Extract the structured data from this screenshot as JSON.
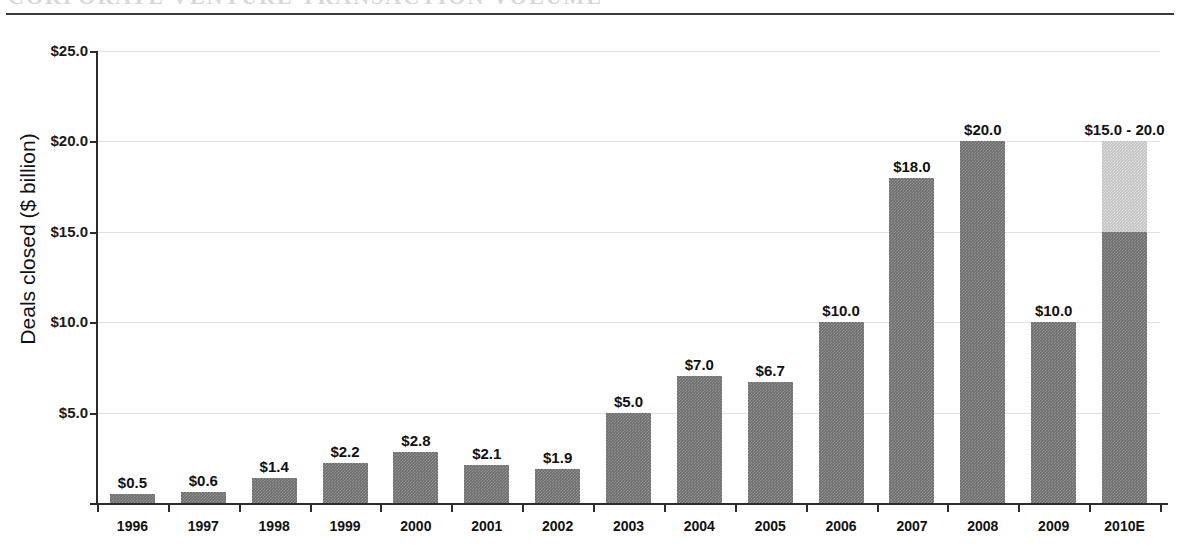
{
  "document": {
    "title_clipped": "CORPORATE VENTURE TRANSACTION VOLUME",
    "rule": "horizontal-rule"
  },
  "chart_data": {
    "type": "bar",
    "title": "",
    "xlabel": "",
    "ylabel": "Deals closed ($ billion)",
    "ylim": [
      0,
      25
    ],
    "ytick_labels": [
      "$25.0",
      "$20.0",
      "$15.0",
      "$10.0",
      "$5.0"
    ],
    "ytick_values": [
      25,
      20,
      15,
      10,
      5
    ],
    "grid": true,
    "legend": "none",
    "categories": [
      "1996",
      "1997",
      "1998",
      "1999",
      "2000",
      "2001",
      "2002",
      "2003",
      "2004",
      "2005",
      "2006",
      "2007",
      "2008",
      "2009",
      "2010E"
    ],
    "values": [
      0.5,
      0.6,
      1.4,
      2.2,
      2.8,
      2.1,
      1.9,
      5.0,
      7.0,
      6.7,
      10.0,
      18.0,
      20.0,
      10.0,
      20.0
    ],
    "value_labels": [
      "$0.5",
      "$0.6",
      "$1.4",
      "$2.2",
      "$2.8",
      "$2.1",
      "$1.9",
      "$5.0",
      "$7.0",
      "$6.7",
      "$10.0",
      "$18.0",
      "$20.0",
      "$10.0",
      "$15.0 - 20.0"
    ],
    "bars": [
      {
        "category": "1996",
        "value": 0.5,
        "label": "$0.5",
        "base_value": 0.5,
        "range_top": null
      },
      {
        "category": "1997",
        "value": 0.6,
        "label": "$0.6",
        "base_value": 0.6,
        "range_top": null
      },
      {
        "category": "1998",
        "value": 1.4,
        "label": "$1.4",
        "base_value": 1.4,
        "range_top": null
      },
      {
        "category": "1999",
        "value": 2.2,
        "label": "$2.2",
        "base_value": 2.2,
        "range_top": null
      },
      {
        "category": "2000",
        "value": 2.8,
        "label": "$2.8",
        "base_value": 2.8,
        "range_top": null
      },
      {
        "category": "2001",
        "value": 2.1,
        "label": "$2.1",
        "base_value": 2.1,
        "range_top": null
      },
      {
        "category": "2002",
        "value": 1.9,
        "label": "$1.9",
        "base_value": 1.9,
        "range_top": null
      },
      {
        "category": "2003",
        "value": 5.0,
        "label": "$5.0",
        "base_value": 5.0,
        "range_top": null
      },
      {
        "category": "2004",
        "value": 7.0,
        "label": "$7.0",
        "base_value": 7.0,
        "range_top": null
      },
      {
        "category": "2005",
        "value": 6.7,
        "label": "$6.7",
        "base_value": 6.7,
        "range_top": null
      },
      {
        "category": "2006",
        "value": 10.0,
        "label": "$10.0",
        "base_value": 10.0,
        "range_top": null
      },
      {
        "category": "2007",
        "value": 18.0,
        "label": "$18.0",
        "base_value": 18.0,
        "range_top": null
      },
      {
        "category": "2008",
        "value": 20.0,
        "label": "$20.0",
        "base_value": 20.0,
        "range_top": null
      },
      {
        "category": "2009",
        "value": 10.0,
        "label": "$10.0",
        "base_value": 10.0,
        "range_top": null
      },
      {
        "category": "2010E",
        "value": 20.0,
        "label": "$15.0 - 20.0",
        "base_value": 15.0,
        "range_top": 20.0
      }
    ],
    "colors": {
      "bar_dark": "#6e6e6e",
      "bar_light": "#c2c2c2",
      "axis": "#2b2b2b",
      "gridline": "#e2e2e2",
      "text": "#111111",
      "background": "#ffffff"
    }
  }
}
